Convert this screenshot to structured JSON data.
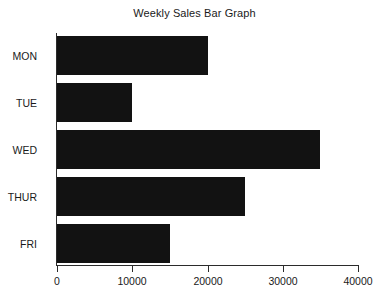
{
  "chart_data": {
    "type": "bar",
    "orientation": "horizontal",
    "title": "Weekly Sales Bar Graph",
    "xlabel": "",
    "ylabel": "",
    "categories": [
      "MON",
      "TUE",
      "WED",
      "THUR",
      "FRI"
    ],
    "values": [
      20000,
      10000,
      35000,
      25000,
      15000
    ],
    "xlim": [
      0,
      40000
    ],
    "xticks": [
      0,
      10000,
      20000,
      30000,
      40000
    ],
    "xtick_labels": [
      "0",
      "10000",
      "20000",
      "30000",
      "40000"
    ],
    "grid": false,
    "legend": false,
    "bar_color": "#121212",
    "axis_color": "#2b2b2b",
    "background_color": "#ffffff"
  }
}
